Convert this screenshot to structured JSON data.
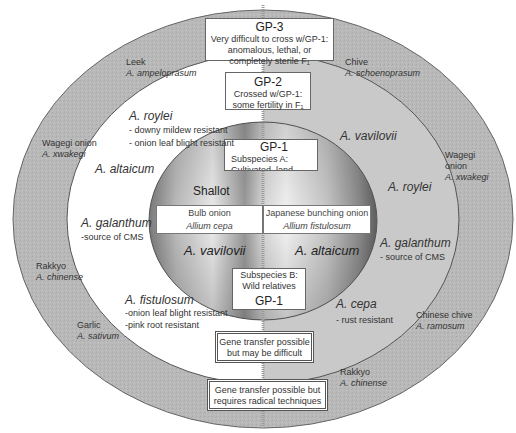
{
  "gp3": {
    "title": "GP-3",
    "lines": [
      "Very  difficult to cross w/GP-1:",
      "anomalous, lethal, or",
      "completely sterile F₁"
    ]
  },
  "gp2": {
    "title": "GP-2",
    "lines": [
      "Crossed w/GP-1:",
      "some fertility in F₁"
    ]
  },
  "gp1_top": {
    "title": "GP-1",
    "lines": [
      "Subspecies A:",
      "Cultivated, land races"
    ]
  },
  "gp1_bottom": {
    "lines": [
      "Subspecies B:",
      "Wild relatives"
    ],
    "title": "GP-1"
  },
  "inner": {
    "shallot": "Shallot",
    "bulb_onion": {
      "common": "Bulb onion",
      "latin": "Allium cepa"
    },
    "bunching_onion": {
      "common": "Japanese bunching onion",
      "latin": "Allium fistulosum"
    },
    "left_bottom": "A. vavilovii",
    "right_bottom": "A. altaicum"
  },
  "middle_ring": {
    "roylei_left": {
      "name": "A. roylei",
      "notes": [
        "- downy mildew resistant",
        "- onion leaf blight resistant"
      ]
    },
    "altaicum_left": "A. altaicum",
    "galanthum_left": {
      "name": "A. galanthum",
      "note": "-source of CMS"
    },
    "fistulosum": {
      "name": "A. fistulosum",
      "notes": [
        "-onion leaf blight resistant",
        "-pink root resistant"
      ]
    },
    "vavilovii_right": "A. vavilovii",
    "roylei_right": "A. roylei",
    "galanthum_right": {
      "name": "A. galanthum",
      "note": "- source of CMS"
    },
    "cepa": {
      "name": "A. cepa",
      "note": "- rust resistant"
    }
  },
  "outer_ring": {
    "leek": {
      "common": "Leek",
      "latin": "A. ampeloprasum"
    },
    "chive": {
      "common": "Chive",
      "latin": "A. schoenoprasum"
    },
    "wagegi_left": {
      "common": "Wagegi onion",
      "latin": "A. xwakegi"
    },
    "wagegi_right": {
      "common": [
        "Wagegi",
        "onion"
      ],
      "latin": "A. xwakegi"
    },
    "rakkyo_left": {
      "common": "Rakkyo",
      "latin": "A. chinense"
    },
    "garlic": {
      "common": "Garlic",
      "latin": "A. sativum"
    },
    "chinese_chive": {
      "common": "Chinese chive",
      "latin": "A. ramosum"
    },
    "rakkyo_bottom": {
      "common": "Rakkyo",
      "latin": "A. chinense"
    }
  },
  "legend": {
    "difficult": [
      "Gene transfer possible",
      "but may be difficult"
    ],
    "radical": [
      "Gene transfer possible but",
      "requires radical techniques"
    ]
  },
  "colors": {
    "outer_ring": "#b8b8b8",
    "middle_right": "#c4c4c4",
    "middle_left": "#ffffff",
    "border": "#555555"
  }
}
